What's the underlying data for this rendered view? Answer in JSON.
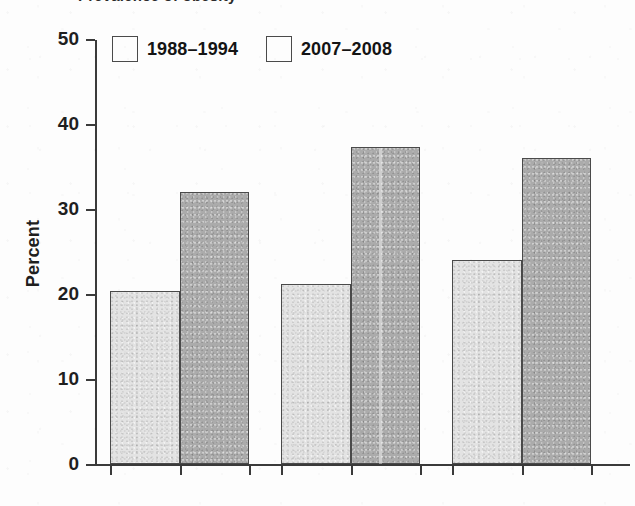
{
  "figure": {
    "top_cropped_text": "Prevalence of obesity",
    "background_color": "#fdfdfd"
  },
  "legend": {
    "position": "top-left-inside",
    "entries": [
      {
        "label": "1988–1994",
        "color": "#e3e3e3",
        "swatch_name": "legend-swatch-1988-1994"
      },
      {
        "label": "2007–2008",
        "color": "#ababab",
        "swatch_name": "legend-swatch-2007-2008"
      }
    ]
  },
  "axes": {
    "y_title": "Percent",
    "y_ticks": [
      "0",
      "10",
      "20",
      "30",
      "40",
      "50"
    ],
    "x_tick_count": 7
  },
  "chart_data": {
    "type": "bar",
    "title": "",
    "subtitle": "",
    "xlabel": "",
    "ylabel": "Percent",
    "ylim": [
      0,
      50
    ],
    "yticks": [
      0,
      10,
      20,
      30,
      40,
      50
    ],
    "grid": false,
    "legend_position": "upper left",
    "categories": [
      "Group 1",
      "Group 2",
      "Group 3"
    ],
    "series": [
      {
        "name": "1988–1994",
        "color": "#e3e3e3",
        "values": [
          20.4,
          21.2,
          24.0
        ]
      },
      {
        "name": "2007–2008",
        "color": "#ababab",
        "values": [
          32.0,
          37.3,
          36.0
        ]
      }
    ],
    "annotations": []
  },
  "bars": [
    {
      "name": "bar-group1-1988-1994",
      "series": "1988–1994",
      "value": 20.4,
      "left": 110,
      "width": 70,
      "class": "series-a"
    },
    {
      "name": "bar-group1-2007-2008",
      "series": "2007–2008",
      "value": 32.0,
      "left": 180,
      "width": 69,
      "class": "series-b"
    },
    {
      "name": "bar-group2-1988-1994",
      "series": "1988–1994",
      "value": 21.2,
      "left": 281,
      "width": 70,
      "class": "series-a"
    },
    {
      "name": "bar-group2-2007-2008",
      "series": "2007–2008",
      "value": 37.3,
      "left": 351,
      "width": 69,
      "class": "series-b"
    },
    {
      "name": "bar-group3-1988-1994",
      "series": "1988–1994",
      "value": 24.0,
      "left": 452,
      "width": 70,
      "class": "series-a"
    },
    {
      "name": "bar-group3-2007-2008",
      "series": "2007–2008",
      "value": 36.0,
      "left": 522,
      "width": 69,
      "class": "series-b"
    }
  ],
  "geometry": {
    "baseline_y": 464,
    "px_per_unit": 8.5,
    "x_ticks": [
      110,
      180,
      249,
      281,
      351,
      420,
      452,
      522,
      591
    ]
  }
}
